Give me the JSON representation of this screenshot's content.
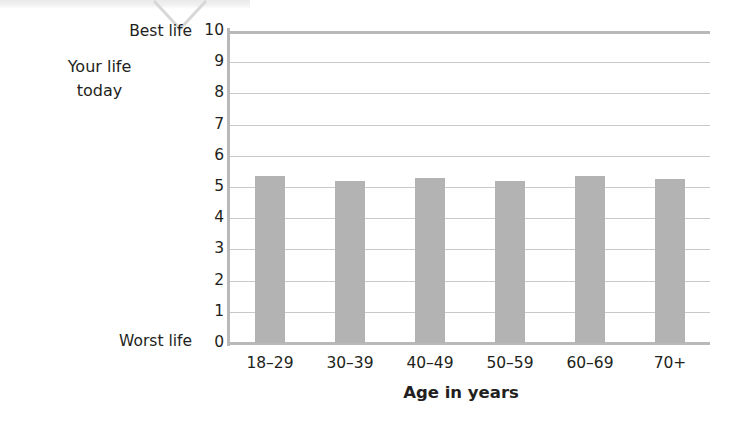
{
  "chart_data": {
    "type": "bar",
    "title": "",
    "subtitle": "",
    "xlabel": "Age in years",
    "ylabel": "Your life today",
    "ylabel_line1": "Your life",
    "ylabel_line2": "today",
    "ylim": [
      0,
      10
    ],
    "ytick_step": 1,
    "grid": true,
    "legend": null,
    "axis_endpoint_labels": {
      "top": "Best life",
      "bottom": "Worst life"
    },
    "categories": [
      "18–29",
      "30–39",
      "40–49",
      "50–59",
      "60–69",
      "70+"
    ],
    "values": [
      5.35,
      5.2,
      5.3,
      5.2,
      5.35,
      5.25
    ],
    "yticks": [
      "10",
      "9",
      "8",
      "7",
      "6",
      "5",
      "4",
      "3",
      "2",
      "1",
      "0"
    ],
    "bar_color": "#b3b3b3",
    "grid_color": "#c9c9c9",
    "axis_color": "#b9b9b9",
    "text_color": "#231f20"
  }
}
